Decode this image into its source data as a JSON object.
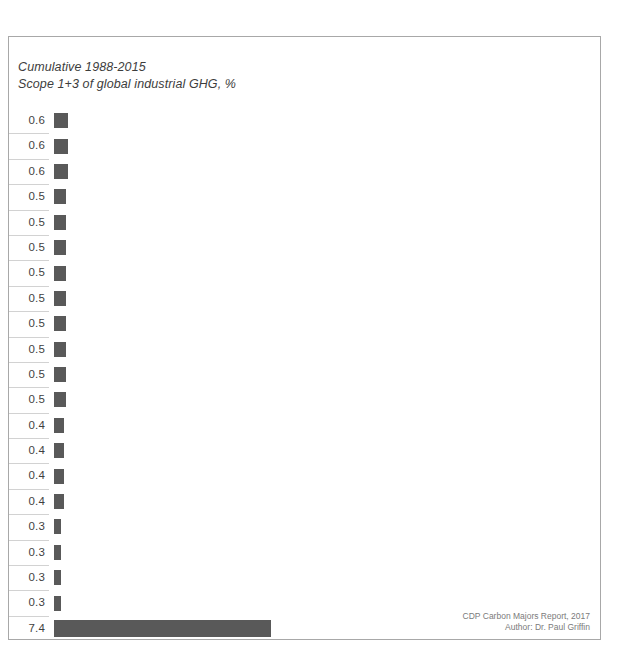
{
  "chart_data": {
    "type": "bar",
    "title": "Cumulative 1988-2015",
    "subtitle": "Scope 1+3 of global industrial GHG, %",
    "xlabel": "",
    "ylabel": "",
    "orientation": "horizontal",
    "grid": false,
    "legend": null,
    "xlim": [
      0,
      7.4
    ],
    "value_unit": "%",
    "categories": [
      "row-1",
      "row-2",
      "row-3",
      "row-4",
      "row-5",
      "row-6",
      "row-7",
      "row-8",
      "row-9",
      "row-10",
      "row-11",
      "row-12",
      "row-13",
      "row-14",
      "row-15",
      "row-16",
      "row-17",
      "row-18",
      "row-19",
      "row-20",
      "total"
    ],
    "values": [
      0.6,
      0.6,
      0.6,
      0.5,
      0.5,
      0.5,
      0.5,
      0.5,
      0.5,
      0.5,
      0.5,
      0.5,
      0.4,
      0.4,
      0.4,
      0.4,
      0.3,
      0.3,
      0.3,
      0.3,
      7.4
    ],
    "labels": [
      "0.6",
      "0.6",
      "0.6",
      "0.5",
      "0.5",
      "0.5",
      "0.5",
      "0.5",
      "0.5",
      "0.5",
      "0.5",
      "0.5",
      "0.4",
      "0.4",
      "0.4",
      "0.4",
      "0.3",
      "0.3",
      "0.3",
      "0.3",
      "7.4"
    ],
    "bar_color": "#595959",
    "separator_color": "#d2d2d2",
    "frame_color": "#a8a8a8"
  },
  "credit": {
    "source": "CDP Carbon Majors Report, 2017",
    "author": "Author: Dr. Paul Griffin"
  }
}
